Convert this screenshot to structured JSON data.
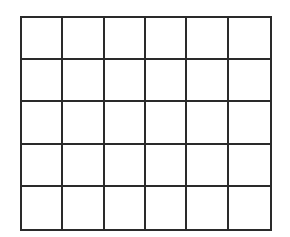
{
  "diagram": {
    "type": "grid",
    "rows": 5,
    "columns": 6,
    "line_color": "#2a2a2a",
    "cell_fill": "#ffffff",
    "cells": [
      [
        "",
        "",
        "",
        "",
        "",
        ""
      ],
      [
        "",
        "",
        "",
        "",
        "",
        ""
      ],
      [
        "",
        "",
        "",
        "",
        "",
        ""
      ],
      [
        "",
        "",
        "",
        "",
        "",
        ""
      ],
      [
        "",
        "",
        "",
        "",
        "",
        ""
      ]
    ]
  }
}
